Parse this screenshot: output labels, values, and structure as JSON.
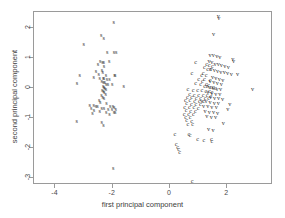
{
  "chart_data": {
    "type": "scatter",
    "title": "",
    "xlabel": "first principal component",
    "ylabel": "second principal component",
    "xlim": [
      -4.75,
      3.6
    ],
    "ylim": [
      -3.25,
      2.55
    ],
    "xticks": [
      -4,
      -2,
      0,
      2
    ],
    "xticklabels": [
      "-4",
      "-2",
      "0",
      "2"
    ],
    "yticks": [
      2,
      1,
      0,
      -1,
      -2,
      -3
    ],
    "yticklabels": [
      "2",
      "1",
      "0",
      "-1",
      "-2",
      "-3"
    ],
    "grid": false,
    "legend": "none",
    "marker_style": "text-label",
    "series": [
      {
        "name": "s",
        "label": "s",
        "color": "#2b2b2b",
        "points": [
          [
            -1.93,
            2.17
          ],
          [
            -2.37,
            1.76
          ],
          [
            -2.28,
            1.63
          ],
          [
            -2.98,
            1.45
          ],
          [
            -2.16,
            1.18
          ],
          [
            -1.92,
            1.18
          ],
          [
            -1.84,
            1.17
          ],
          [
            -2.4,
            0.87
          ],
          [
            -2.32,
            0.85
          ],
          [
            -2.28,
            0.84
          ],
          [
            -2.09,
            0.86
          ],
          [
            -2.48,
            0.78
          ],
          [
            -2.27,
            0.69
          ],
          [
            -2.55,
            0.55
          ],
          [
            -2.34,
            0.56
          ],
          [
            -2.31,
            0.52
          ],
          [
            -3.12,
            0.4
          ],
          [
            -2.45,
            0.43
          ],
          [
            -2.2,
            0.4
          ],
          [
            -1.9,
            0.4
          ],
          [
            -1.88,
            0.39
          ],
          [
            -2.63,
            0.33
          ],
          [
            -2.42,
            0.32
          ],
          [
            -2.3,
            0.31
          ],
          [
            -2.27,
            0.3
          ],
          [
            -2.17,
            0.27
          ],
          [
            -2.08,
            0.26
          ],
          [
            -2.35,
            0.2
          ],
          [
            -2.29,
            0.18
          ],
          [
            -2.24,
            0.16
          ],
          [
            -3.21,
            0.14
          ],
          [
            -2.19,
            0.11
          ],
          [
            -2.13,
            0.1
          ],
          [
            -1.98,
            0.1
          ],
          [
            -1.58,
            0.04
          ],
          [
            -2.3,
            0.02
          ],
          [
            -2.27,
            0.0
          ],
          [
            -2.24,
            -0.02
          ],
          [
            -2.2,
            -0.06
          ],
          [
            -2.33,
            -0.1
          ],
          [
            -2.29,
            -0.14
          ],
          [
            -2.26,
            -0.18
          ],
          [
            -2.21,
            -0.22
          ],
          [
            -2.36,
            -0.28
          ],
          [
            -2.31,
            -0.32
          ],
          [
            -2.27,
            -0.36
          ],
          [
            -2.44,
            -0.45
          ],
          [
            -2.4,
            -0.5
          ],
          [
            -2.18,
            -0.52
          ],
          [
            -2.77,
            -0.6
          ],
          [
            -2.63,
            -0.61
          ],
          [
            -2.55,
            -0.63
          ],
          [
            -2.5,
            -0.64
          ],
          [
            -2.05,
            -0.63
          ],
          [
            -1.96,
            -0.64
          ],
          [
            -1.91,
            -0.66
          ],
          [
            -2.72,
            -0.7
          ],
          [
            -2.35,
            -0.7
          ],
          [
            -2.27,
            -0.71
          ],
          [
            -2.12,
            -0.72
          ],
          [
            -1.99,
            -0.74
          ],
          [
            -1.86,
            -0.72
          ],
          [
            -2.62,
            -0.78
          ],
          [
            -2.42,
            -0.8
          ],
          [
            -2.19,
            -0.82
          ],
          [
            -1.92,
            -0.83
          ],
          [
            -1.88,
            -0.84
          ],
          [
            -2.67,
            -0.88
          ],
          [
            -2.08,
            -0.91
          ],
          [
            -3.22,
            -1.14
          ],
          [
            -2.35,
            -1.16
          ],
          [
            -2.29,
            -1.26
          ],
          [
            -1.95,
            -2.73
          ]
        ]
      },
      {
        "name": "c",
        "label": "c",
        "color": "#2b2b2b",
        "points": [
          [
            0.93,
            0.83
          ],
          [
            1.32,
            0.77
          ],
          [
            1.4,
            0.74
          ],
          [
            1.52,
            0.69
          ],
          [
            1.24,
            0.66
          ],
          [
            1.35,
            0.62
          ],
          [
            1.45,
            0.62
          ],
          [
            0.8,
            0.48
          ],
          [
            1.19,
            0.47
          ],
          [
            1.14,
            0.42
          ],
          [
            1.3,
            0.41
          ],
          [
            1.04,
            0.28
          ],
          [
            1.24,
            0.26
          ],
          [
            1.44,
            0.23
          ],
          [
            1.17,
            0.2
          ],
          [
            0.93,
            0.12
          ],
          [
            1.11,
            0.11
          ],
          [
            1.31,
            0.09
          ],
          [
            1.38,
            0.06
          ],
          [
            1.25,
            0.03
          ],
          [
            1.33,
            0.02
          ],
          [
            1.47,
            0.0
          ],
          [
            1.55,
            -0.01
          ],
          [
            1.62,
            -0.02
          ],
          [
            0.66,
            -0.08
          ],
          [
            0.84,
            -0.09
          ],
          [
            1.0,
            -0.1
          ],
          [
            1.15,
            -0.11
          ],
          [
            1.29,
            -0.12
          ],
          [
            1.41,
            -0.13
          ],
          [
            1.5,
            -0.16
          ],
          [
            0.72,
            -0.24
          ],
          [
            0.88,
            -0.25
          ],
          [
            1.04,
            -0.26
          ],
          [
            1.19,
            -0.27
          ],
          [
            1.33,
            -0.28
          ],
          [
            1.46,
            -0.29
          ],
          [
            0.64,
            -0.33
          ],
          [
            0.79,
            -0.34
          ],
          [
            0.95,
            -0.35
          ],
          [
            1.11,
            -0.36
          ],
          [
            1.26,
            -0.37
          ],
          [
            1.39,
            -0.38
          ],
          [
            0.57,
            -0.44
          ],
          [
            0.73,
            -0.45
          ],
          [
            0.9,
            -0.46
          ],
          [
            1.06,
            -0.47
          ],
          [
            1.21,
            -0.48
          ],
          [
            0.62,
            -0.55
          ],
          [
            0.78,
            -0.56
          ],
          [
            0.94,
            -0.57
          ],
          [
            1.1,
            -0.58
          ],
          [
            0.55,
            -0.66
          ],
          [
            0.71,
            -0.67
          ],
          [
            0.87,
            -0.68
          ],
          [
            1.02,
            -0.69
          ],
          [
            0.6,
            -0.78
          ],
          [
            0.76,
            -0.79
          ],
          [
            0.92,
            -0.8
          ],
          [
            0.53,
            -0.89
          ],
          [
            0.69,
            -0.9
          ],
          [
            0.85,
            -0.91
          ],
          [
            0.58,
            -1.0
          ],
          [
            0.74,
            -1.01
          ],
          [
            0.62,
            -1.12
          ],
          [
            0.79,
            -1.13
          ],
          [
            0.66,
            -1.24
          ],
          [
            0.83,
            -1.25
          ],
          [
            0.21,
            -1.57
          ],
          [
            0.7,
            -1.59
          ],
          [
            0.74,
            -1.62
          ],
          [
            1.0,
            -1.73
          ],
          [
            1.48,
            -1.73
          ],
          [
            1.5,
            -1.8
          ],
          [
            1.22,
            -1.76
          ],
          [
            0.25,
            -1.92
          ],
          [
            0.3,
            -2.0
          ],
          [
            0.34,
            -2.09
          ],
          [
            0.37,
            -2.17
          ],
          [
            0.81,
            -3.15
          ]
        ]
      },
      {
        "name": "v",
        "label": "v",
        "color": "#2b2b2b",
        "points": [
          [
            1.72,
            2.38
          ],
          [
            1.74,
            2.33
          ],
          [
            1.56,
            1.79
          ],
          [
            1.44,
            1.08
          ],
          [
            1.55,
            1.06
          ],
          [
            1.67,
            1.04
          ],
          [
            1.78,
            1.01
          ],
          [
            2.23,
            0.93
          ],
          [
            2.26,
            0.88
          ],
          [
            1.4,
            0.88
          ],
          [
            1.5,
            0.83
          ],
          [
            1.61,
            0.79
          ],
          [
            1.72,
            0.76
          ],
          [
            1.83,
            0.73
          ],
          [
            1.95,
            0.7
          ],
          [
            2.07,
            0.66
          ],
          [
            1.47,
            0.62
          ],
          [
            1.58,
            0.58
          ],
          [
            1.7,
            0.55
          ],
          [
            1.81,
            0.52
          ],
          [
            1.93,
            0.5
          ],
          [
            2.05,
            0.48
          ],
          [
            2.18,
            0.45
          ],
          [
            2.4,
            0.44
          ],
          [
            1.52,
            0.34
          ],
          [
            1.64,
            0.31
          ],
          [
            1.76,
            0.28
          ],
          [
            1.88,
            0.25
          ],
          [
            1.44,
            0.19
          ],
          [
            1.57,
            0.16
          ],
          [
            1.69,
            0.13
          ],
          [
            1.83,
            0.1
          ],
          [
            1.41,
            0.0
          ],
          [
            1.54,
            -0.02
          ],
          [
            1.68,
            -0.05
          ],
          [
            1.8,
            -0.08
          ],
          [
            2.92,
            -0.05
          ],
          [
            1.36,
            -0.18
          ],
          [
            1.5,
            -0.2
          ],
          [
            1.64,
            -0.22
          ],
          [
            1.78,
            -0.24
          ],
          [
            1.45,
            -0.34
          ],
          [
            1.59,
            -0.36
          ],
          [
            1.73,
            -0.38
          ],
          [
            1.87,
            -0.4
          ],
          [
            1.15,
            -0.46
          ],
          [
            1.3,
            -0.48
          ],
          [
            1.44,
            -0.5
          ],
          [
            1.58,
            -0.52
          ],
          [
            1.72,
            -0.54
          ],
          [
            2.13,
            -0.56
          ],
          [
            1.21,
            -0.62
          ],
          [
            1.36,
            -0.64
          ],
          [
            1.5,
            -0.66
          ],
          [
            1.65,
            -0.68
          ],
          [
            2.06,
            -0.74
          ],
          [
            1.26,
            -0.8
          ],
          [
            1.41,
            -0.82
          ],
          [
            1.56,
            -0.84
          ],
          [
            1.7,
            -0.86
          ],
          [
            1.32,
            -0.97
          ],
          [
            1.48,
            -0.99
          ],
          [
            1.63,
            -1.01
          ],
          [
            1.9,
            -1.22
          ],
          [
            1.38,
            -1.4
          ],
          [
            1.54,
            -1.43
          ]
        ]
      }
    ]
  }
}
